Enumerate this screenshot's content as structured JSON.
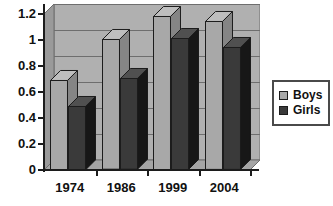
{
  "chart_data": {
    "type": "bar",
    "title": "",
    "subtitle": "",
    "xlabel": "",
    "ylabel": "",
    "categories": [
      "1974",
      "1986",
      "1999",
      "2004"
    ],
    "series": [
      {
        "name": "Boys",
        "color": "#a8a8a8",
        "values": [
          0.68,
          0.99,
          1.17,
          1.13
        ]
      },
      {
        "name": "Girls",
        "color": "#3a3a3a",
        "values": [
          0.48,
          0.69,
          1.0,
          0.93
        ]
      }
    ],
    "ylim": [
      0,
      1.2
    ],
    "yticks": [
      "0",
      "0.2",
      "0.4",
      "0.6",
      "0.8",
      "1",
      "1.2"
    ],
    "ytick_values": [
      0,
      0.2,
      0.4,
      0.6,
      0.8,
      1,
      1.2
    ],
    "grid": true,
    "grid_axis": "y",
    "legend_position": "right",
    "style": "3d-column",
    "plot_background": "#b0b0b0"
  },
  "legend": {
    "entries": [
      {
        "label": "Boys",
        "swatch": "#a8a8a8"
      },
      {
        "label": "Girls",
        "swatch": "#3a3a3a"
      }
    ]
  },
  "colors": {
    "plot_background": "#b0b0b0",
    "wall_side": "#9a9a9a",
    "floor": "#a5a5a5",
    "gridline": "#6e6e6e",
    "axis": "#1c1c1c",
    "boys": "#a8a8a8",
    "girls": "#3a3a3a",
    "text": "#111111",
    "page_background": "#ffffff"
  }
}
